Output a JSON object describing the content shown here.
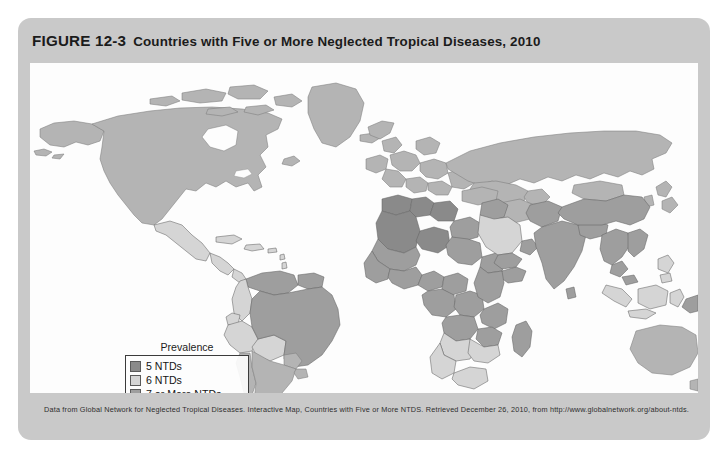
{
  "figure": {
    "number": "FIGURE 12-3",
    "title": "Countries with Five or More Neglected Tropical Diseases, 2010",
    "source_note": "Data from Global Network for Neglected Tropical Diseases. Interactive Map, Countries with Five or More NTDS. Retrieved December 26, 2010, from http://www.globalnetwork.org/about-ntds.",
    "card_background": "#c9c9c9",
    "panel_background": "#fdfdfd"
  },
  "legend": {
    "title": "Prevalence",
    "items": [
      {
        "label": "5 NTDs",
        "color": "#8a8a8a"
      },
      {
        "label": "6 NTDs",
        "color": "#d5d5d5"
      },
      {
        "label": "7 or More NTDs",
        "color": "#9e9e9e"
      }
    ]
  },
  "map": {
    "projection": "equirectangular",
    "ocean_color": "#fdfdfd",
    "no_data_color": "#b4b4b4",
    "border_color": "#646464",
    "classes": {
      "ntd_5": "#8a8a8a",
      "ntd_6": "#d5d5d5",
      "ntd_7_plus": "#9e9e9e",
      "no_data": "#b4b4b4"
    },
    "regions": [
      {
        "name": "North America",
        "class": "no_data"
      },
      {
        "name": "Greenland",
        "class": "no_data"
      },
      {
        "name": "Mexico",
        "class": "ntd_6"
      },
      {
        "name": "Central America",
        "class": "ntd_6"
      },
      {
        "name": "Caribbean",
        "class": "ntd_6"
      },
      {
        "name": "Brazil",
        "class": "ntd_7_plus"
      },
      {
        "name": "Venezuela",
        "class": "ntd_7_plus"
      },
      {
        "name": "Colombia",
        "class": "ntd_6"
      },
      {
        "name": "Peru",
        "class": "ntd_6"
      },
      {
        "name": "Bolivia",
        "class": "ntd_6"
      },
      {
        "name": "Argentina",
        "class": "no_data"
      },
      {
        "name": "Chile",
        "class": "no_data"
      },
      {
        "name": "Europe",
        "class": "no_data"
      },
      {
        "name": "Russia",
        "class": "no_data"
      },
      {
        "name": "North Africa",
        "class": "ntd_5"
      },
      {
        "name": "Egypt",
        "class": "ntd_7_plus"
      },
      {
        "name": "West Africa",
        "class": "ntd_7_plus"
      },
      {
        "name": "Nigeria",
        "class": "ntd_7_plus"
      },
      {
        "name": "Central Africa",
        "class": "ntd_7_plus"
      },
      {
        "name": "East Africa",
        "class": "ntd_7_plus"
      },
      {
        "name": "Southern Africa",
        "class": "ntd_6"
      },
      {
        "name": "Madagascar",
        "class": "ntd_7_plus"
      },
      {
        "name": "Saudi Arabia",
        "class": "ntd_6"
      },
      {
        "name": "Yemen",
        "class": "ntd_7_plus"
      },
      {
        "name": "India",
        "class": "ntd_7_plus"
      },
      {
        "name": "China",
        "class": "ntd_7_plus"
      },
      {
        "name": "Southeast Asia",
        "class": "ntd_7_plus"
      },
      {
        "name": "Indonesia",
        "class": "ntd_6"
      },
      {
        "name": "Philippines",
        "class": "ntd_6"
      },
      {
        "name": "Papua New Guinea",
        "class": "ntd_7_plus"
      },
      {
        "name": "Australia",
        "class": "no_data"
      }
    ]
  }
}
